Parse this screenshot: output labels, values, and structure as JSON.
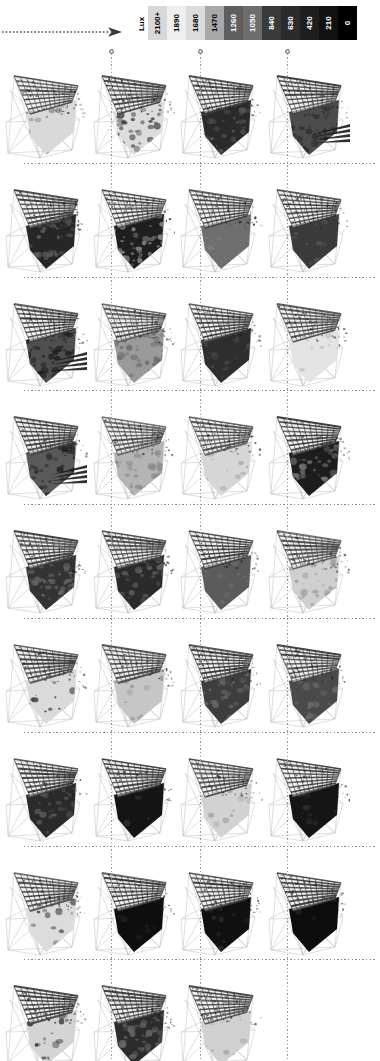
{
  "figure": {
    "type": "simulation-matrix"
  },
  "arrow": {
    "name": "time-progression-arrow",
    "style": "dotted-right-arrow"
  },
  "legend": {
    "title": "Lux",
    "orientation": "vertical-text-horizontal-bar",
    "stops": [
      {
        "label": "2100+",
        "color": "#d8d8d8",
        "text_color": "#000000"
      },
      {
        "label": "1890",
        "color": "#efefef",
        "text_color": "#000000"
      },
      {
        "label": "1680",
        "color": "#dcdcdc",
        "text_color": "#000000"
      },
      {
        "label": "1470",
        "color": "#a8a8a8",
        "text_color": "#000000"
      },
      {
        "label": "1260",
        "color": "#5e5e5e",
        "text_color": "#ffffff"
      },
      {
        "label": "1050",
        "color": "#6d6d6d",
        "text_color": "#ffffff"
      },
      {
        "label": "840",
        "color": "#3a3a3a",
        "text_color": "#ffffff"
      },
      {
        "label": "630",
        "color": "#2b2b2b",
        "text_color": "#ffffff"
      },
      {
        "label": "420",
        "color": "#1e1e1e",
        "text_color": "#ffffff"
      },
      {
        "label": "210",
        "color": "#121212",
        "text_color": "#ffffff"
      },
      {
        "label": "0",
        "color": "#000000",
        "text_color": "#ffffff"
      }
    ]
  },
  "grid": {
    "columns": 4,
    "rows": 9,
    "total_cells": 35,
    "column_divider_x": [
      111,
      199.5,
      287
    ],
    "cells": [
      {
        "r": 0,
        "c": 0,
        "floor": "#d9d9d9",
        "roof": "#4a4a4a",
        "blob": "#7a7a7a",
        "blob_density": 0.1,
        "fan": false
      },
      {
        "r": 0,
        "c": 1,
        "floor": "#dcdcdc",
        "roof": "#454545",
        "blob": "#3c3c3c",
        "blob_density": 0.34,
        "fan": false
      },
      {
        "r": 0,
        "c": 2,
        "floor": "#2a2a2a",
        "roof": "#3a3a3a",
        "blob": "#555555",
        "blob_density": 0.4,
        "fan": false
      },
      {
        "r": 0,
        "c": 3,
        "floor": "#4c4c4c",
        "roof": "#3e3e3e",
        "blob": "#2a2a2a",
        "blob_density": 0.42,
        "fan": true
      },
      {
        "r": 1,
        "c": 0,
        "floor": "#262626",
        "roof": "#3f3f3f",
        "blob": "#606060",
        "blob_density": 0.44,
        "fan": false
      },
      {
        "r": 1,
        "c": 1,
        "floor": "#1f1f1f",
        "roof": "#434343",
        "blob": "#8d8d8d",
        "blob_density": 0.46,
        "fan": false
      },
      {
        "r": 1,
        "c": 2,
        "floor": "#6e6e6e",
        "roof": "#3c3c3c",
        "blob": "#7d7d7d",
        "blob_density": 0.16,
        "fan": false
      },
      {
        "r": 1,
        "c": 3,
        "floor": "#3a3a3a",
        "roof": "#3a3a3a",
        "blob": "#555555",
        "blob_density": 0.2,
        "fan": false
      },
      {
        "r": 2,
        "c": 0,
        "floor": "#4f4f4f",
        "roof": "#3d3d3d",
        "blob": "#1c1c1c",
        "blob_density": 0.5,
        "fan": true
      },
      {
        "r": 2,
        "c": 1,
        "floor": "#9a9a9a",
        "roof": "#4a4a4a",
        "blob": "#6a6a6a",
        "blob_density": 0.44,
        "fan": false
      },
      {
        "r": 2,
        "c": 2,
        "floor": "#2e2e2e",
        "roof": "#3b3b3b",
        "blob": "#4a4a4a",
        "blob_density": 0.3,
        "fan": false
      },
      {
        "r": 2,
        "c": 3,
        "floor": "#e4e4e4",
        "roof": "#4d4d4d",
        "blob": "#c0c0c0",
        "blob_density": 0.12,
        "fan": false
      },
      {
        "r": 3,
        "c": 0,
        "floor": "#5a5a5a",
        "roof": "#3c3c3c",
        "blob": "#222222",
        "blob_density": 0.52,
        "fan": true
      },
      {
        "r": 3,
        "c": 1,
        "floor": "#b4b4b4",
        "roof": "#4b4b4b",
        "blob": "#8a8a8a",
        "blob_density": 0.4,
        "fan": false
      },
      {
        "r": 3,
        "c": 2,
        "floor": "#d6d6d6",
        "roof": "#4a4a4a",
        "blob": "#9c9c9c",
        "blob_density": 0.14,
        "fan": false
      },
      {
        "r": 3,
        "c": 3,
        "floor": "#1d1d1d",
        "roof": "#3a3a3a",
        "blob": "#767676",
        "blob_density": 0.48,
        "fan": false
      },
      {
        "r": 4,
        "c": 0,
        "floor": "#333333",
        "roof": "#3e3e3e",
        "blob": "#6e6e6e",
        "blob_density": 0.5,
        "fan": false
      },
      {
        "r": 4,
        "c": 1,
        "floor": "#2b2b2b",
        "roof": "#404040",
        "blob": "#5f5f5f",
        "blob_density": 0.42,
        "fan": false
      },
      {
        "r": 4,
        "c": 2,
        "floor": "#5b5b5b",
        "roof": "#3d3d3d",
        "blob": "#6b6b6b",
        "blob_density": 0.22,
        "fan": false
      },
      {
        "r": 4,
        "c": 3,
        "floor": "#cfcfcf",
        "roof": "#474747",
        "blob": "#9e9e9e",
        "blob_density": 0.38,
        "fan": false
      },
      {
        "r": 5,
        "c": 0,
        "floor": "#dadada",
        "roof": "#3c3c3c",
        "blob": "#2e2e2e",
        "blob_density": 0.14,
        "fan": false
      },
      {
        "r": 5,
        "c": 1,
        "floor": "#c6c6c6",
        "roof": "#464646",
        "blob": "#8f8f8f",
        "blob_density": 0.1,
        "fan": false
      },
      {
        "r": 5,
        "c": 2,
        "floor": "#3e3e3e",
        "roof": "#3b3b3b",
        "blob": "#6a6a6a",
        "blob_density": 0.36,
        "fan": false
      },
      {
        "r": 5,
        "c": 3,
        "floor": "#4a4a4a",
        "roof": "#3f3f3f",
        "blob": "#707070",
        "blob_density": 0.3,
        "fan": false
      },
      {
        "r": 6,
        "c": 0,
        "floor": "#2a2a2a",
        "roof": "#3d3d3d",
        "blob": "#5c5c5c",
        "blob_density": 0.46,
        "fan": false
      },
      {
        "r": 6,
        "c": 1,
        "floor": "#141414",
        "roof": "#3a3a3a",
        "blob": "#3a3a3a",
        "blob_density": 0.08,
        "fan": false
      },
      {
        "r": 6,
        "c": 2,
        "floor": "#d2d2d2",
        "roof": "#474747",
        "blob": "#a4a4a4",
        "blob_density": 0.12,
        "fan": false
      },
      {
        "r": 6,
        "c": 3,
        "floor": "#151515",
        "roof": "#3c3c3c",
        "blob": "#2f2f2f",
        "blob_density": 0.1,
        "fan": false
      },
      {
        "r": 7,
        "c": 0,
        "floor": "#dcdcdc",
        "roof": "#3e3e3e",
        "blob": "#343434",
        "blob_density": 0.16,
        "fan": false
      },
      {
        "r": 7,
        "c": 1,
        "floor": "#0e0e0e",
        "roof": "#3a3a3a",
        "blob": "#262626",
        "blob_density": 0.08,
        "fan": false
      },
      {
        "r": 7,
        "c": 2,
        "floor": "#101010",
        "roof": "#3b3b3b",
        "blob": "#2a2a2a",
        "blob_density": 0.1,
        "fan": false
      },
      {
        "r": 7,
        "c": 3,
        "floor": "#0c0c0c",
        "roof": "#3a3a3a",
        "blob": "#242424",
        "blob_density": 0.08,
        "fan": false
      },
      {
        "r": 8,
        "c": 0,
        "floor": "#d4d4d4",
        "roof": "#3f3f3f",
        "blob": "#2c2c2c",
        "blob_density": 0.18,
        "fan": false
      },
      {
        "r": 8,
        "c": 1,
        "floor": "#2c2c2c",
        "roof": "#3c3c3c",
        "blob": "#6a6a6a",
        "blob_density": 0.52,
        "fan": false
      },
      {
        "r": 8,
        "c": 2,
        "floor": "#d0d0d0",
        "roof": "#414141",
        "blob": "#a0a0a0",
        "blob_density": 0.1,
        "fan": false
      }
    ]
  }
}
